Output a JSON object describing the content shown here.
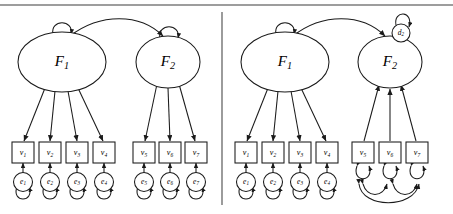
{
  "figure": {
    "type": "sem-path-diagram",
    "panels": [
      {
        "id": "left",
        "model": "reflective-cfa-correlated-factors",
        "latents": [
          {
            "name": "F1",
            "label": "F",
            "sub": "1",
            "cx": 62,
            "cy": 62,
            "rx": 44,
            "ry": 30,
            "self_loop": true
          },
          {
            "name": "F2",
            "label": "F",
            "sub": "2",
            "cx": 168,
            "cy": 62,
            "rx": 32,
            "ry": 26,
            "self_loop": true
          }
        ],
        "factor_covariance": {
          "from": "F1",
          "to": "F2",
          "double_headed": true
        },
        "observed": [
          {
            "name": "v1",
            "label": "v",
            "sub": "1",
            "cx": 23,
            "cy": 154,
            "parent": "F1"
          },
          {
            "name": "v2",
            "label": "v",
            "sub": "2",
            "cx": 50,
            "cy": 154,
            "parent": "F1"
          },
          {
            "name": "v3",
            "label": "v",
            "sub": "3",
            "cx": 77,
            "cy": 154,
            "parent": "F1"
          },
          {
            "name": "v4",
            "label": "v",
            "sub": "4",
            "cx": 104,
            "cy": 154,
            "parent": "F1"
          },
          {
            "name": "v5",
            "label": "v",
            "sub": "5",
            "cx": 144,
            "cy": 154,
            "parent": "F2"
          },
          {
            "name": "v6",
            "label": "v",
            "sub": "6",
            "cx": 170,
            "cy": 154,
            "parent": "F2"
          },
          {
            "name": "v7",
            "label": "v",
            "sub": "7",
            "cx": 196,
            "cy": 154,
            "parent": "F2"
          }
        ],
        "errors": [
          {
            "name": "e1",
            "label": "e",
            "sub": "1",
            "cx": 23,
            "cy": 182,
            "target": "v1"
          },
          {
            "name": "e2",
            "label": "e",
            "sub": "2",
            "cx": 50,
            "cy": 182,
            "target": "v2"
          },
          {
            "name": "e3",
            "label": "e",
            "sub": "3",
            "cx": 77,
            "cy": 182,
            "target": "v3"
          },
          {
            "name": "e4",
            "label": "e",
            "sub": "4",
            "cx": 104,
            "cy": 182,
            "target": "v4"
          },
          {
            "name": "e5",
            "label": "e",
            "sub": "5",
            "cx": 144,
            "cy": 182,
            "target": "v5"
          },
          {
            "name": "e6",
            "label": "e",
            "sub": "6",
            "cx": 170,
            "cy": 182,
            "target": "v6"
          },
          {
            "name": "e7",
            "label": "e",
            "sub": "7",
            "cx": 196,
            "cy": 182,
            "target": "v7"
          }
        ],
        "loading_direction": "latent-to-observed",
        "error_self_loops": true
      },
      {
        "id": "right",
        "model": "formative-composite-with-disturbance",
        "latents": [
          {
            "name": "F1",
            "label": "F",
            "sub": "1",
            "cx": 285,
            "cy": 62,
            "rx": 44,
            "ry": 30,
            "self_loop": true
          },
          {
            "name": "F2",
            "label": "F",
            "sub": "2",
            "cx": 390,
            "cy": 62,
            "rx": 32,
            "ry": 26,
            "self_loop": false
          }
        ],
        "structural_path": {
          "from": "F1",
          "to": "F2",
          "double_headed": false
        },
        "disturbance": {
          "name": "d2",
          "label": "d",
          "sub": "2",
          "cx": 401,
          "cy": 33,
          "r": 9,
          "target": "F2",
          "self_loop": true
        },
        "observed": [
          {
            "name": "v1",
            "label": "v",
            "sub": "1",
            "cx": 246,
            "cy": 154,
            "parent": "F1",
            "direction": "latent-to-observed"
          },
          {
            "name": "v2",
            "label": "v",
            "sub": "2",
            "cx": 273,
            "cy": 154,
            "parent": "F1",
            "direction": "latent-to-observed"
          },
          {
            "name": "v3",
            "label": "v",
            "sub": "3",
            "cx": 300,
            "cy": 154,
            "parent": "F1",
            "direction": "latent-to-observed"
          },
          {
            "name": "v4",
            "label": "v",
            "sub": "4",
            "cx": 327,
            "cy": 154,
            "parent": "F1",
            "direction": "latent-to-observed"
          },
          {
            "name": "v5",
            "label": "v",
            "sub": "5",
            "cx": 363,
            "cy": 154,
            "parent": "F2",
            "direction": "observed-to-latent"
          },
          {
            "name": "v6",
            "label": "v",
            "sub": "6",
            "cx": 390,
            "cy": 154,
            "parent": "F2",
            "direction": "observed-to-latent"
          },
          {
            "name": "v7",
            "label": "v",
            "sub": "7",
            "cx": 417,
            "cy": 154,
            "parent": "F2",
            "direction": "observed-to-latent"
          }
        ],
        "errors": [
          {
            "name": "e1",
            "label": "e",
            "sub": "1",
            "cx": 246,
            "cy": 182,
            "target": "v1"
          },
          {
            "name": "e2",
            "label": "e",
            "sub": "2",
            "cx": 273,
            "cy": 182,
            "target": "v2"
          },
          {
            "name": "e3",
            "label": "e",
            "sub": "3",
            "cx": 300,
            "cy": 182,
            "target": "v3"
          },
          {
            "name": "e4",
            "label": "e",
            "sub": "4",
            "cx": 327,
            "cy": 182,
            "target": "v4"
          }
        ],
        "exogenous_variances": [
          "v5",
          "v6",
          "v7"
        ],
        "exogenous_covariances": [
          {
            "from": "v5",
            "to": "v6"
          },
          {
            "from": "v6",
            "to": "v7"
          },
          {
            "from": "v5",
            "to": "v7"
          }
        ]
      }
    ],
    "divider": {
      "x": 222,
      "y1": 12,
      "y2": 205
    },
    "top_rule": {
      "y": 5
    },
    "colors": {
      "stroke": "#1a1a1a",
      "fill": "#ffffff",
      "rule": "#3c3c3c",
      "background": "#ffffff"
    }
  }
}
